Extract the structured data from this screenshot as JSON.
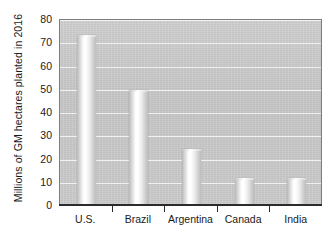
{
  "chart_data": {
    "type": "bar",
    "title": "",
    "subtitle": "",
    "xlabel": "",
    "ylabel": "Millions of GM hectares planted in 2016",
    "categories": [
      "U.S.",
      "Brazil",
      "Argentina",
      "Canada",
      "India"
    ],
    "values": [
      72.5,
      49,
      23.5,
      11,
      11
    ],
    "ylim": [
      0,
      80
    ],
    "ytick_labels": [
      "80",
      "70",
      "60",
      "50",
      "40",
      "30",
      "20",
      "10",
      "0"
    ],
    "ytick_values": [
      80,
      70,
      60,
      50,
      40,
      30,
      20,
      10,
      0
    ],
    "ytick_step": 10,
    "grid": true,
    "legend": null,
    "legend_position": "none",
    "annotations": [],
    "colors": {
      "plot_background": "#c8c8c8",
      "gridline": "#f4f4f4",
      "bar_fill": "#ffffff",
      "bar_edge": "#bdbdbd",
      "axis": "#2b2b2b",
      "text": "#1a1a1a",
      "page_background": "#ffffff"
    }
  }
}
